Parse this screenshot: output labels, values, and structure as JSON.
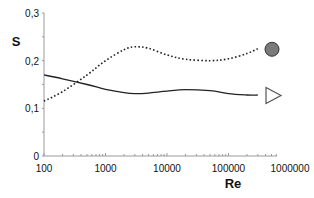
{
  "chart_data": {
    "type": "line",
    "title": "",
    "xlabel": "Re",
    "ylabel": "S",
    "xscale": "log",
    "xlim": [
      100,
      1000000
    ],
    "ylim": [
      0,
      0.3
    ],
    "grid": false,
    "x_ticks": [
      "100",
      "1000",
      "10000",
      "100000",
      "1000000"
    ],
    "y_ticks": [
      "0",
      "0,1",
      "0,2",
      "0,3"
    ],
    "legend": "markers at right end of curves (circle = dotted series, triangle = solid series)",
    "series": [
      {
        "name": "circle",
        "style": "dotted",
        "marker": "filled-circle",
        "x": [
          100,
          200,
          500,
          1000,
          2000,
          3000,
          5000,
          10000,
          20000,
          50000,
          100000,
          200000,
          300000
        ],
        "y": [
          0.115,
          0.135,
          0.17,
          0.2,
          0.223,
          0.229,
          0.226,
          0.212,
          0.203,
          0.2,
          0.204,
          0.215,
          0.225
        ]
      },
      {
        "name": "triangle",
        "style": "solid",
        "marker": "open-triangle-right",
        "x": [
          100,
          200,
          500,
          1000,
          2000,
          3000,
          5000,
          10000,
          20000,
          50000,
          100000,
          200000,
          300000
        ],
        "y": [
          0.17,
          0.162,
          0.15,
          0.14,
          0.133,
          0.131,
          0.132,
          0.136,
          0.139,
          0.137,
          0.131,
          0.128,
          0.128
        ]
      }
    ]
  }
}
